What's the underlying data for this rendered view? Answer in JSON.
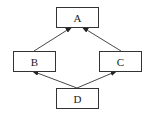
{
  "diagram": {
    "type": "directed-graph",
    "nodes": [
      {
        "id": "A",
        "label": "A",
        "x": 56,
        "y": 7,
        "w": 42,
        "h": 20
      },
      {
        "id": "B",
        "label": "B",
        "x": 13,
        "y": 51,
        "w": 42,
        "h": 20
      },
      {
        "id": "C",
        "label": "C",
        "x": 99,
        "y": 51,
        "w": 42,
        "h": 20
      },
      {
        "id": "D",
        "label": "D",
        "x": 56,
        "y": 88,
        "w": 42,
        "h": 20
      }
    ],
    "edges": [
      {
        "from": "B",
        "to": "A",
        "x1": 34,
        "y1": 51,
        "x2": 72,
        "y2": 27
      },
      {
        "from": "C",
        "to": "A",
        "x1": 121,
        "y1": 51,
        "x2": 82,
        "y2": 27
      },
      {
        "from": "D",
        "to": "B",
        "x1": 77,
        "y1": 88,
        "x2": 32,
        "y2": 71
      },
      {
        "from": "D",
        "to": "C",
        "x1": 77,
        "y1": 88,
        "x2": 117,
        "y2": 71
      }
    ],
    "colors": {
      "stroke": "#333333",
      "background": "#ffffff",
      "text": "#222222"
    }
  }
}
